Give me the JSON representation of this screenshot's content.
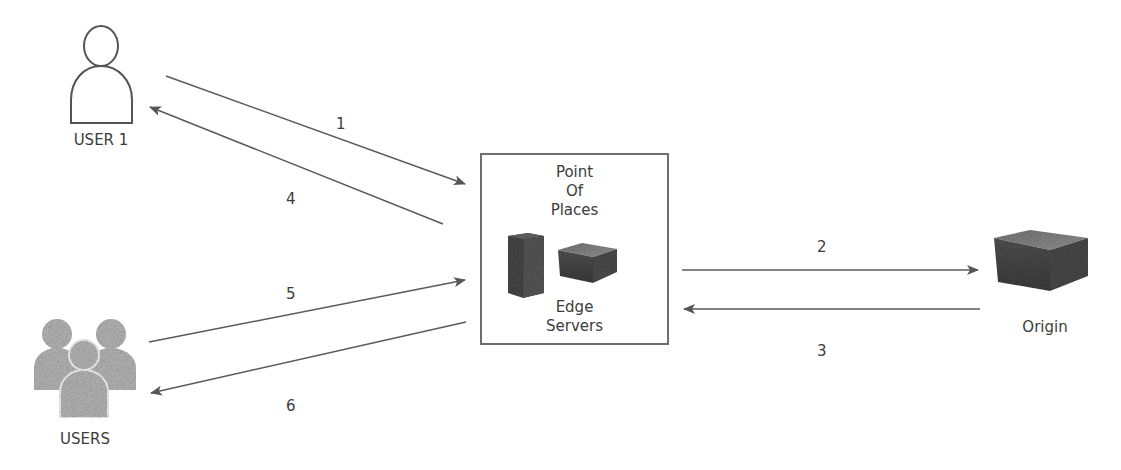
{
  "diagram": {
    "nodes": {
      "user1": {
        "label": "USER 1",
        "icon": "user-outline-icon"
      },
      "users": {
        "label": "USERS",
        "icon": "users-group-icon"
      },
      "pop": {
        "title_lines": [
          "Point",
          "Of",
          "Places"
        ],
        "subtitle_lines": [
          "Edge",
          "Servers"
        ],
        "icons": [
          "tower-server-icon",
          "box-server-icon"
        ]
      },
      "origin": {
        "label": "Origin",
        "icon": "origin-server-icon"
      }
    },
    "edges": [
      {
        "id": "1",
        "label": "1",
        "from": "USER 1",
        "to": "Point Of Places"
      },
      {
        "id": "2",
        "label": "2",
        "from": "Point Of Places",
        "to": "Origin"
      },
      {
        "id": "3",
        "label": "3",
        "from": "Origin",
        "to": "Point Of Places"
      },
      {
        "id": "4",
        "label": "4",
        "from": "Point Of Places",
        "to": "USER 1"
      },
      {
        "id": "5",
        "label": "5",
        "from": "USERS",
        "to": "Point Of Places"
      },
      {
        "id": "6",
        "label": "6",
        "from": "Point Of Places",
        "to": "USERS"
      }
    ],
    "colors": {
      "line": "#5a5a5a",
      "text": "#3c3c3c",
      "users_icon": "#b8b8b8",
      "server": "#555555"
    }
  }
}
